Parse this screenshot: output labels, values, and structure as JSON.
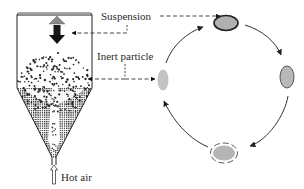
{
  "diagram": {
    "labels": {
      "suspension": "Suspension",
      "inert_particle": "Inert particle",
      "hot_air": "Hot air"
    },
    "cycle": {
      "stages": [
        {
          "position": "top",
          "description": "particle coated with suspension (dark outline)",
          "fill": "#b0b0b0",
          "stroke": "#222222"
        },
        {
          "position": "right",
          "description": "coated particle drying",
          "fill": "#b8b8b8",
          "stroke": "#555555"
        },
        {
          "position": "bottom",
          "description": "dried coating peeling (dashed outline)",
          "fill": "#b5b5b5",
          "stroke": "#444444"
        },
        {
          "position": "left",
          "description": "clean inert particle",
          "fill": "#c4c4c4",
          "stroke": "none"
        }
      ],
      "direction": "clockwise"
    },
    "colors": {
      "line": "#222222",
      "arrow_gray": "#8a8a8a",
      "arrow_black": "#111111",
      "hatch": "#333333"
    }
  }
}
